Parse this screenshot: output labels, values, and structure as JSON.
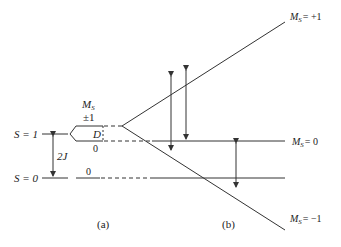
{
  "diagram": {
    "stroke_color": "#333333",
    "panel_a": {
      "caption": "(a)",
      "level_s1": "S = 1",
      "level_s0": "S = 0",
      "gap_label": "2J",
      "ms_header": "M",
      "ms_sub": "S",
      "ms_pm1": "±1",
      "zfs_label": "D",
      "ms_zero_upper": "0",
      "ms_zero_lower": "0"
    },
    "panel_b": {
      "caption": "(b)",
      "branch_plus": {
        "m": "M",
        "sub": "S",
        "value": "= +1"
      },
      "branch_zero": {
        "m": "M",
        "sub": "S",
        "value": "= 0"
      },
      "branch_minus": {
        "m": "M",
        "sub": "S",
        "value": "= −1"
      }
    }
  }
}
